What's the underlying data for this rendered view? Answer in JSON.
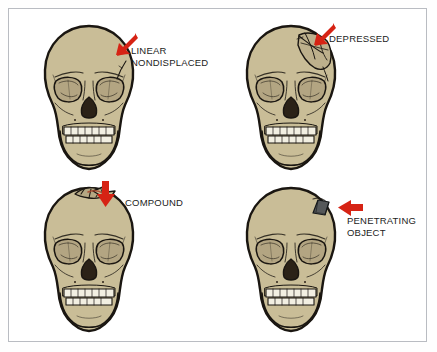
{
  "figure": {
    "background_color": "#ffffff",
    "frame_color": "#b9bcc2",
    "arrow_color": "#d62314",
    "bone_color": "#c9bd97",
    "bone_outline_color": "#1a1611",
    "tooth_color": "#f2efe2",
    "cavity_color": "#2b2217",
    "object_color": "#55585a"
  },
  "panels": [
    {
      "id": "linear",
      "label": "LINEAR\nNONDISPLACED",
      "label_lines": [
        "LINEAR",
        "NONDISPLACED"
      ],
      "arrow": {
        "name": "down-left-arrow-icon",
        "direction": "down-left"
      },
      "injury": "hairline crack on right parietal region",
      "has_penetrating_object": false
    },
    {
      "id": "depressed",
      "label": "DEPRESSED",
      "label_lines": [
        "DEPRESSED"
      ],
      "arrow": {
        "name": "down-left-arrow-icon",
        "direction": "down-left"
      },
      "injury": "caved-in fragmented area on right frontal/parietal region",
      "has_penetrating_object": false
    },
    {
      "id": "compound",
      "label": "COMPOUND",
      "label_lines": [
        "COMPOUND"
      ],
      "arrow": {
        "name": "down-arrow-icon",
        "direction": "down"
      },
      "injury": "open wound with protruding bone fragments at vertex",
      "has_penetrating_object": false
    },
    {
      "id": "penetrating",
      "label": "PENETRATING\nOBJECT",
      "label_lines": [
        "PENETRATING",
        "OBJECT"
      ],
      "arrow": {
        "name": "left-arrow-icon",
        "direction": "left"
      },
      "injury": "foreign object lodged in right parietal region",
      "has_penetrating_object": true
    }
  ]
}
